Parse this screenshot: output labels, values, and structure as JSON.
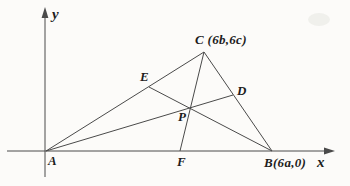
{
  "labels": {
    "y_axis": "y",
    "x_axis": "x",
    "point_a": "A",
    "point_b": "B(6a,0)",
    "point_c": "C (6b,6c)",
    "point_d": "D",
    "point_e": "E",
    "point_f": "F",
    "point_p": "P"
  },
  "colors": {
    "ink": "#4a4a4a",
    "text": "#1d1d1d",
    "background": "#fcfbf9"
  },
  "geometry": {
    "points": {
      "A": {
        "x": 46,
        "y": 151
      },
      "B": {
        "x": 272,
        "y": 151
      },
      "C": {
        "x": 204,
        "y": 52
      },
      "D": {
        "x": 233,
        "y": 95
      },
      "E": {
        "x": 149,
        "y": 87
      },
      "F": {
        "x": 180,
        "y": 151
      },
      "P": {
        "x": 190,
        "y": 108
      }
    },
    "segments": [
      [
        "A",
        "C"
      ],
      [
        "C",
        "B"
      ],
      [
        "A",
        "D"
      ],
      [
        "B",
        "E"
      ],
      [
        "C",
        "F"
      ]
    ],
    "x_axis": {
      "from": {
        "x": 7,
        "y": 151
      },
      "to": {
        "x": 330,
        "y": 151
      }
    },
    "y_axis": {
      "from": {
        "x": 45,
        "y": 177
      },
      "to": {
        "x": 45,
        "y": 12
      }
    }
  }
}
